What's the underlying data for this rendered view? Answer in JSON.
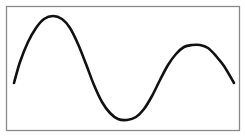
{
  "chart_data": {
    "type": "line",
    "title": "",
    "xlabel": "",
    "ylabel": "",
    "grid": false,
    "legend": null,
    "axes_visible": false,
    "frame": true,
    "frame_color": "#8a8a8a",
    "line_color": "#111111",
    "series": [
      {
        "name": "wave",
        "points_px": [
          [
            14,
            83
          ],
          [
            20,
            62
          ],
          [
            28,
            42
          ],
          [
            36,
            28
          ],
          [
            44,
            19
          ],
          [
            53,
            16
          ],
          [
            62,
            19
          ],
          [
            70,
            28
          ],
          [
            78,
            44
          ],
          [
            86,
            64
          ],
          [
            94,
            85
          ],
          [
            102,
            102
          ],
          [
            110,
            113
          ],
          [
            118,
            119
          ],
          [
            127,
            120
          ],
          [
            136,
            117
          ],
          [
            144,
            109
          ],
          [
            152,
            96
          ],
          [
            160,
            80
          ],
          [
            168,
            65
          ],
          [
            176,
            54
          ],
          [
            184,
            47
          ],
          [
            192,
            45
          ],
          [
            200,
            45
          ],
          [
            208,
            48
          ],
          [
            216,
            56
          ],
          [
            224,
            66
          ],
          [
            234,
            83
          ]
        ]
      }
    ],
    "annotations": [],
    "layout": {
      "frame_box": {
        "x": 6,
        "y": 6,
        "width": 234,
        "height": 125
      }
    }
  }
}
